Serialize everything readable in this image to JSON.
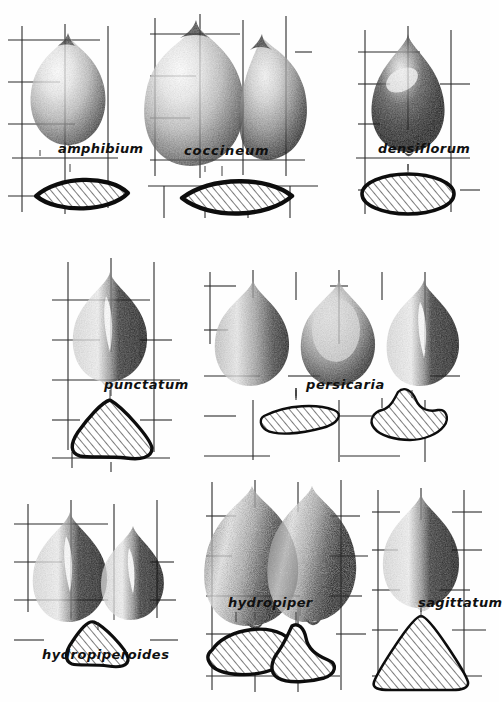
{
  "plate": {
    "title": "Polygonum achene identification plate",
    "description": "Nine panels of shaded achene drawings with scale grids and hatched cross-sections",
    "background_color": "#fefefe",
    "ink_color": "#101010",
    "grid_color": "#2a2a2a",
    "hatch_color": "#1a1a1a",
    "hatch_fill": "#ffffff",
    "rows": 3,
    "columns": 3
  },
  "panels": [
    {
      "id": "amphibium",
      "label": "amphibium",
      "row": 1,
      "column": 1,
      "seed_count": 1,
      "seed_shapes": [
        "broad-ovoid-beaked"
      ],
      "section_count": 1,
      "section_shapes": [
        "lenticular-pointed"
      ],
      "section_outline": "thick",
      "label_x": 60,
      "label_y": 148,
      "grid_x": 6,
      "grid_y": 22,
      "grid_cols": 4,
      "grid_rows": 5
    },
    {
      "id": "coccineum",
      "label": "coccineum",
      "row": 1,
      "column": 2,
      "seed_count": 2,
      "seed_shapes": [
        "broad-ovoid-beaked",
        "ovoid-oblique"
      ],
      "section_count": 1,
      "section_shapes": [
        "lenticular-broad"
      ],
      "section_outline": "thick",
      "label_x": 188,
      "label_y": 150,
      "grid_x": 148,
      "grid_y": 12,
      "grid_cols": 5,
      "grid_rows": 6
    },
    {
      "id": "densiflorum",
      "label": "densiflorum",
      "row": 1,
      "column": 3,
      "seed_count": 1,
      "seed_shapes": [
        "onion-shaped-dark"
      ],
      "section_count": 1,
      "section_shapes": [
        "ellipse"
      ],
      "section_outline": "thick",
      "label_x": 382,
      "label_y": 148,
      "grid_x": 352,
      "grid_y": 26,
      "grid_cols": 4,
      "grid_rows": 5
    },
    {
      "id": "punctatum",
      "label": "punctatum",
      "row": 2,
      "column": 1,
      "seed_count": 1,
      "seed_shapes": [
        "trigonous-ridged"
      ],
      "section_count": 1,
      "section_shapes": [
        "rounded-triangle"
      ],
      "section_outline": "thick",
      "label_x": 108,
      "label_y": 384,
      "grid_x": 54,
      "grid_y": 258,
      "grid_cols": 4,
      "grid_rows": 5
    },
    {
      "id": "persicaria",
      "label": "persicaria",
      "row": 2,
      "column": 2,
      "seed_count": 3,
      "seed_shapes": [
        "teardrop-dark",
        "teardrop-pale",
        "trigonous-ridged"
      ],
      "section_count": 2,
      "section_shapes": [
        "kidney-lens",
        "trilobed"
      ],
      "section_outline": "thin",
      "label_x": 312,
      "label_y": 384,
      "grid_x": 202,
      "grid_y": 268,
      "grid_cols": 6,
      "grid_rows": 5
    },
    {
      "id": "hydropiperoides",
      "label": "hydropiperoides",
      "row": 3,
      "column": 1,
      "seed_count": 2,
      "seed_shapes": [
        "trigonous-ridged",
        "trigonous-small"
      ],
      "section_count": 1,
      "section_shapes": [
        "rounded-triangle"
      ],
      "section_outline": "thick",
      "label_x": 44,
      "label_y": 654,
      "grid_x": 12,
      "grid_y": 500,
      "grid_cols": 4,
      "grid_rows": 5
    },
    {
      "id": "hydropiper",
      "label": "hydropiper",
      "row": 3,
      "column": 2,
      "seed_count": 2,
      "seed_shapes": [
        "ovoid-grainy",
        "ovoid-grainy"
      ],
      "section_count": 2,
      "section_shapes": [
        "oval",
        "trilobed"
      ],
      "section_outline": "thick",
      "label_x": 230,
      "label_y": 602,
      "grid_x": 200,
      "grid_y": 478,
      "grid_cols": 5,
      "grid_rows": 6
    },
    {
      "id": "sagittatum",
      "label": "sagittatum",
      "row": 3,
      "column": 3,
      "seed_count": 1,
      "seed_shapes": [
        "trigonous-half-dark"
      ],
      "section_count": 1,
      "section_shapes": [
        "triangle-large"
      ],
      "section_outline": "thin",
      "label_x": 422,
      "label_y": 602,
      "grid_x": 370,
      "grid_y": 486,
      "grid_cols": 4,
      "grid_rows": 5
    }
  ],
  "grid": {
    "cell_width": 43,
    "cell_height": 42,
    "stroke_width": 1.1,
    "style": "broken-segment-scale-grid"
  },
  "labels_font": {
    "style": "italic",
    "weight": "bold",
    "size_px": 12.5
  }
}
